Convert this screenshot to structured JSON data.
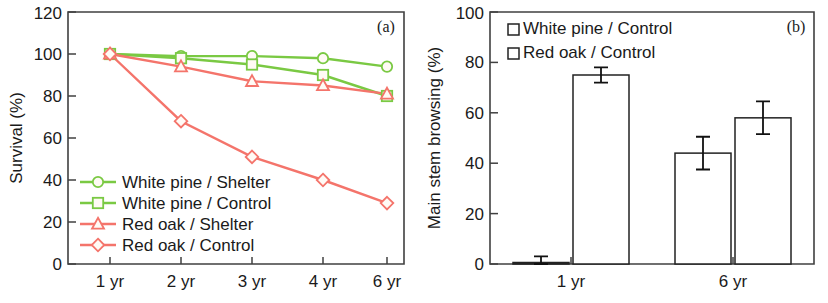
{
  "figure": {
    "width": 828,
    "height": 303,
    "background": "#ffffff"
  },
  "chart_data": [
    {
      "type": "line",
      "panel_tag": "(a)",
      "title": "",
      "xlabel": "",
      "ylabel": "Survival (%)",
      "categories": [
        "1 yr",
        "2 yr",
        "3 yr",
        "4 yr",
        "6 yr"
      ],
      "xtick_labels": [
        "1 yr",
        "2 yr",
        "3 yr",
        "4 yr",
        "6 yr"
      ],
      "ytick_labels": [
        "0",
        "20",
        "40",
        "60",
        "80",
        "100",
        "120"
      ],
      "ylim": [
        0,
        120
      ],
      "ytick_values": [
        0,
        20,
        40,
        60,
        80,
        100,
        120
      ],
      "grid": false,
      "legend_position": "lower-left-inside",
      "series": [
        {
          "name": "White pine / Shelter",
          "marker": "circle",
          "color": "#7ac943",
          "values": [
            100,
            99,
            99,
            98,
            94
          ]
        },
        {
          "name": "White pine / Control",
          "marker": "square",
          "color": "#7ac943",
          "values": [
            100,
            98,
            95,
            90,
            80
          ]
        },
        {
          "name": "Red oak / Shelter",
          "marker": "triangle",
          "color": "#f4746b",
          "values": [
            100,
            94,
            87,
            85,
            81
          ]
        },
        {
          "name": "Red oak / Control",
          "marker": "diamond",
          "color": "#f4746b",
          "values": [
            100,
            68,
            51,
            40,
            29
          ]
        }
      ]
    },
    {
      "type": "bar",
      "panel_tag": "(b)",
      "title": "",
      "xlabel": "",
      "ylabel": "Main stem browsing (%)",
      "categories": [
        "1 yr",
        "6 yr"
      ],
      "xtick_labels": [
        "1 yr",
        "6 yr"
      ],
      "ytick_labels": [
        "0",
        "20",
        "40",
        "60",
        "80",
        "100"
      ],
      "ylim": [
        0,
        100
      ],
      "ytick_values": [
        0,
        20,
        40,
        60,
        80,
        100
      ],
      "grid": false,
      "legend_position": "top-left-inside",
      "series": [
        {
          "name": "White pine / Control",
          "values": [
            0.5,
            44
          ],
          "errors": [
            2.5,
            6.5
          ]
        },
        {
          "name": "Red oak / Control",
          "values": [
            75,
            58
          ],
          "errors": [
            3,
            6.5
          ]
        }
      ]
    }
  ]
}
